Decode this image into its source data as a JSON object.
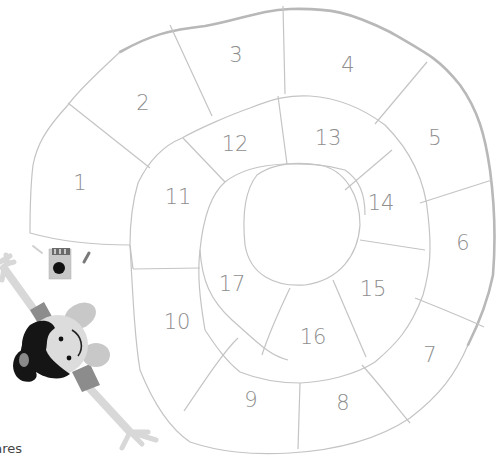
{
  "board": {
    "type": "spiral board game",
    "squares": [
      {
        "label": "1",
        "x": 80,
        "y": 190
      },
      {
        "label": "2",
        "x": 143,
        "y": 108
      },
      {
        "label": "3",
        "x": 236,
        "y": 60
      },
      {
        "label": "4",
        "x": 348,
        "y": 70
      },
      {
        "label": "5",
        "x": 435,
        "y": 142
      },
      {
        "label": "6",
        "x": 463,
        "y": 249
      },
      {
        "label": "7",
        "x": 430,
        "y": 360
      },
      {
        "label": "8",
        "x": 343,
        "y": 410
      },
      {
        "label": "9",
        "x": 251,
        "y": 405
      },
      {
        "label": "10",
        "x": 177,
        "y": 329
      },
      {
        "label": "11",
        "x": 178,
        "y": 202
      },
      {
        "label": "12",
        "x": 235,
        "y": 149
      },
      {
        "label": "13",
        "x": 328,
        "y": 143
      },
      {
        "label": "14",
        "x": 381,
        "y": 208
      },
      {
        "label": "15",
        "x": 373,
        "y": 294
      },
      {
        "label": "16",
        "x": 313,
        "y": 342
      },
      {
        "label": "17",
        "x": 232,
        "y": 289
      }
    ],
    "colors": {
      "line": "#c4c4c4",
      "outer_border": "#b8b8b8",
      "number": "#8e8e8e"
    }
  },
  "illustrations": {
    "die": "die-icon",
    "player": "child-player-figure"
  },
  "caption": "uares"
}
